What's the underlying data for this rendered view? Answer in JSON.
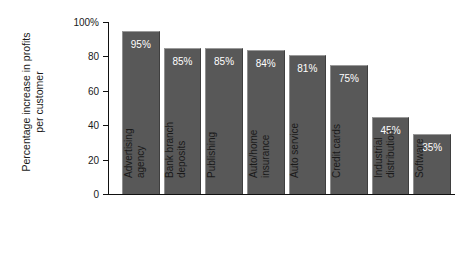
{
  "chart_data": {
    "type": "bar",
    "title": "",
    "xlabel": "",
    "ylabel": "Percentage increase in profits per customer",
    "ylabel_lines": [
      "Percentage increase in profits",
      "per customer"
    ],
    "categories": [
      "Advertising agency",
      "Bank branch deposits",
      "Publishing",
      "Auto/home insurance",
      "Auto service",
      "Credit cards",
      "Industrial distribution",
      "Software"
    ],
    "category_lines": [
      [
        "Advertising",
        "agency"
      ],
      [
        "Bank branch",
        "deposits"
      ],
      [
        "Publishing"
      ],
      [
        "Auto/home",
        "insurance"
      ],
      [
        "Auto service"
      ],
      [
        "Credit cards"
      ],
      [
        "Industrial",
        "distribution"
      ],
      [
        "Software"
      ]
    ],
    "values": [
      95,
      85,
      85,
      84,
      81,
      75,
      45,
      35
    ],
    "value_labels": [
      "95%",
      "85%",
      "85%",
      "84%",
      "81%",
      "75%",
      "45%",
      "35%"
    ],
    "ylim": [
      0,
      100
    ],
    "yticks": [
      0,
      20,
      40,
      60,
      80,
      100
    ],
    "ytick_labels": [
      "0",
      "20",
      "40",
      "60",
      "80",
      "100%"
    ],
    "grid": false,
    "legend": false,
    "bar_color": "#585858",
    "value_label_color": "#ffffff",
    "axis_color": "#111111",
    "background_color": "#ffffff"
  }
}
